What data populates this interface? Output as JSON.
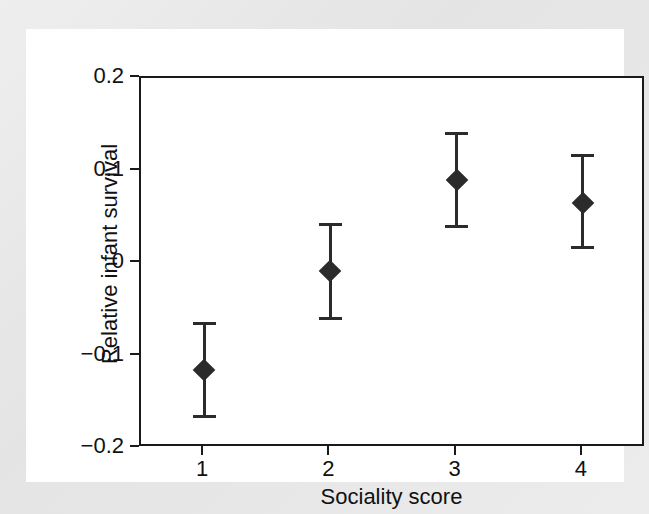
{
  "figure": {
    "background_color": "#e9e9e9",
    "canvas_color": "#ffffff",
    "axis_color": "#1a1a1a",
    "marker_color": "#2b2b2b"
  },
  "chart_data": {
    "type": "scatter",
    "title": "",
    "xlabel": "Sociality score",
    "ylabel": "Relative infant survival",
    "xlim": [
      0.5,
      4.5
    ],
    "ylim": [
      -0.2,
      0.2
    ],
    "xticks": [
      1,
      2,
      3,
      4
    ],
    "xtick_labels": [
      "1",
      "2",
      "3",
      "4"
    ],
    "yticks": [
      0.2,
      0.1,
      0,
      -0.1,
      -0.2
    ],
    "ytick_labels": [
      "0.2",
      "0.1",
      "0",
      "−0.1",
      "−0.2"
    ],
    "grid": false,
    "legend": false,
    "marker_style": "filled-diamond",
    "error_bars": "vertical-with-caps",
    "categories": [
      "1",
      "2",
      "3",
      "4"
    ],
    "x": [
      1,
      2,
      3,
      4
    ],
    "values": [
      -0.116,
      -0.009,
      0.09,
      0.065
    ],
    "err_low": [
      -0.167,
      -0.06,
      0.039,
      0.016
    ],
    "err_high": [
      -0.065,
      0.042,
      0.141,
      0.117
    ],
    "points": [
      {
        "x": 1,
        "y": -0.116,
        "lower": -0.167,
        "upper": -0.065
      },
      {
        "x": 2,
        "y": -0.009,
        "lower": -0.06,
        "upper": 0.042
      },
      {
        "x": 3,
        "y": 0.09,
        "lower": 0.039,
        "upper": 0.141
      },
      {
        "x": 4,
        "y": 0.065,
        "lower": 0.016,
        "upper": 0.117
      }
    ]
  }
}
